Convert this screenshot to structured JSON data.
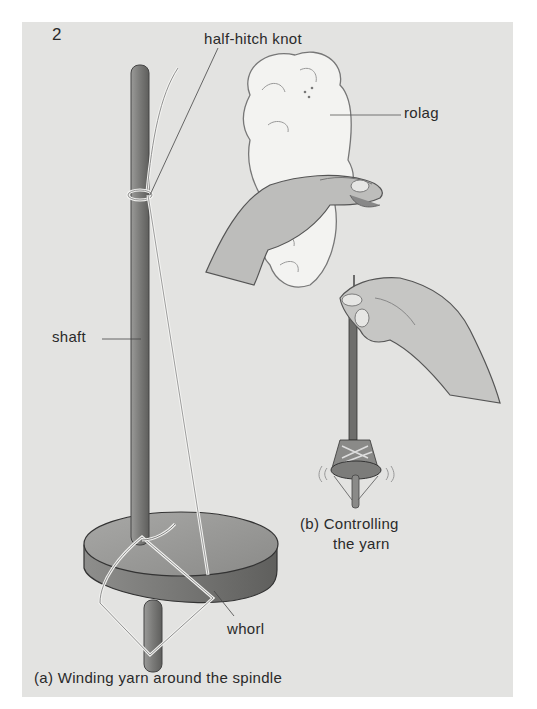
{
  "figure": {
    "number": "2",
    "labels": {
      "half_hitch_knot": "half-hitch knot",
      "rolag": "rolag",
      "shaft": "shaft",
      "whorl": "whorl"
    },
    "captions": {
      "b_line1": "(b) Controlling",
      "b_line2": "the yarn",
      "a": "(a)  Winding yarn around the spindle"
    },
    "colors": {
      "page_background": "#ffffff",
      "panel_background": "#e3e3e1",
      "ink": "#2a2a2a"
    }
  }
}
